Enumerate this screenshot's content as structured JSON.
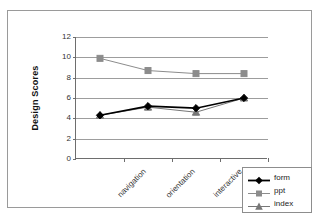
{
  "chart_data": {
    "type": "line",
    "title": "",
    "xlabel": "",
    "ylabel": "Design Scores",
    "categories": [
      "navigation",
      "orientation",
      "interactive",
      "screen"
    ],
    "ylim": [
      0,
      12
    ],
    "yticks": [
      0,
      2,
      4,
      6,
      8,
      10,
      12
    ],
    "grid": true,
    "legend_position": "bottom-right",
    "series": [
      {
        "name": "form",
        "values": [
          4.3,
          5.2,
          5.0,
          6.0
        ],
        "color": "#000000",
        "marker": "diamond"
      },
      {
        "name": "ppt",
        "values": [
          9.9,
          8.7,
          8.4,
          8.4
        ],
        "color": "#8c8c8c",
        "marker": "square"
      },
      {
        "name": "index",
        "values": [
          4.3,
          5.1,
          4.6,
          6.0
        ],
        "color": "#777777",
        "marker": "triangle"
      }
    ]
  },
  "legend": {
    "items": [
      {
        "label": "form"
      },
      {
        "label": "ppt"
      },
      {
        "label": "index"
      }
    ]
  },
  "axis": {
    "y_tick_labels": [
      "0",
      "2",
      "4",
      "6",
      "8",
      "10",
      "12"
    ],
    "y_title": "Design Scores",
    "x_tick_labels": [
      "navigation",
      "orientation",
      "interactive",
      "screen"
    ]
  }
}
